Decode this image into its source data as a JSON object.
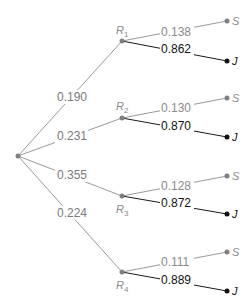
{
  "diagram": {
    "type": "probability-tree",
    "root": {
      "label": ""
    },
    "branches": [
      {
        "node": "R",
        "subscript": "1",
        "probability": "0.190",
        "children": [
          {
            "outcome": "S",
            "probability": "0.138"
          },
          {
            "outcome": "J",
            "probability": "0.862"
          }
        ]
      },
      {
        "node": "R",
        "subscript": "2",
        "probability": "0.231",
        "children": [
          {
            "outcome": "S",
            "probability": "0.130"
          },
          {
            "outcome": "J",
            "probability": "0.870"
          }
        ]
      },
      {
        "node": "R",
        "subscript": "3",
        "probability": "0.355",
        "children": [
          {
            "outcome": "S",
            "probability": "0.128"
          },
          {
            "outcome": "J",
            "probability": "0.872"
          }
        ]
      },
      {
        "node": "R",
        "subscript": "4",
        "probability": "0.224",
        "children": [
          {
            "outcome": "S",
            "probability": "0.111"
          },
          {
            "outcome": "J",
            "probability": "0.889"
          }
        ]
      }
    ]
  },
  "colors": {
    "gray_edge": "#9a9a9a",
    "dark_edge": "#1a1a1a",
    "gray_text": "#8a8a8a",
    "dark_text": "#111111"
  }
}
